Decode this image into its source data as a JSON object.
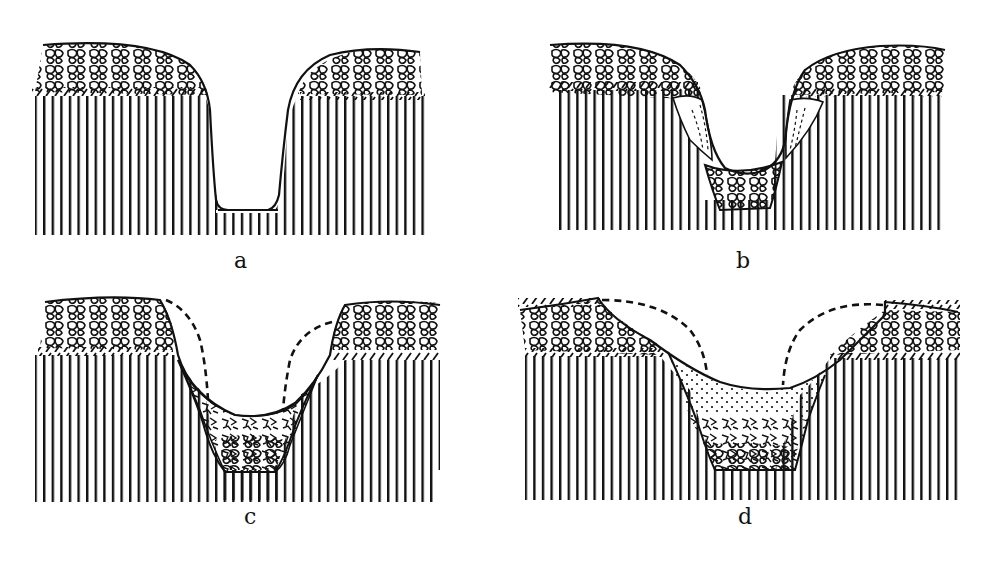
{
  "figure": {
    "type": "geological cross-section diagram",
    "ink_color": "#111111",
    "background_color": "#ffffff",
    "panels": [
      {
        "id": "a",
        "label": "a",
        "stage": "valley cut into bedrock beneath gravel cap"
      },
      {
        "id": "b",
        "label": "b",
        "stage": "slope material slumping, valley floor gravel fill"
      },
      {
        "id": "c",
        "label": "c",
        "stage": "slopes retreated (dashed former profile), mixed fill"
      },
      {
        "id": "d",
        "label": "d",
        "stage": "further slope retreat, fine dotted fill over coarse fill"
      }
    ]
  }
}
